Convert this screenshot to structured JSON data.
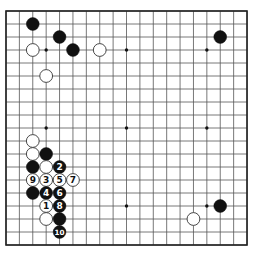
{
  "board": {
    "size": 19,
    "origin_x": 6,
    "origin_y": 11,
    "step_x": 13.39,
    "step_y": 13.0,
    "stone_radius": 6.4,
    "colors": {
      "background": "#ffffff",
      "line": "#555555",
      "border": "#222222",
      "black_stone": "#111111",
      "white_stone": "#ffffff",
      "white_outline": "#333333",
      "star": "#111111"
    },
    "star_points": [
      [
        3,
        3
      ],
      [
        9,
        3
      ],
      [
        15,
        3
      ],
      [
        3,
        9
      ],
      [
        9,
        9
      ],
      [
        15,
        9
      ],
      [
        3,
        15
      ],
      [
        9,
        15
      ],
      [
        15,
        15
      ]
    ],
    "stones": [
      {
        "color": "black",
        "col": 2,
        "row": 1,
        "label": ""
      },
      {
        "color": "black",
        "col": 4,
        "row": 2,
        "label": ""
      },
      {
        "color": "black",
        "col": 5,
        "row": 3,
        "label": ""
      },
      {
        "color": "white",
        "col": 2,
        "row": 3,
        "label": ""
      },
      {
        "color": "white",
        "col": 7,
        "row": 3,
        "label": ""
      },
      {
        "color": "white",
        "col": 3,
        "row": 5,
        "label": ""
      },
      {
        "color": "black",
        "col": 16,
        "row": 2,
        "label": ""
      },
      {
        "color": "white",
        "col": 2,
        "row": 10,
        "label": ""
      },
      {
        "color": "white",
        "col": 2,
        "row": 11,
        "label": ""
      },
      {
        "color": "black",
        "col": 3,
        "row": 11,
        "label": ""
      },
      {
        "color": "black",
        "col": 2,
        "row": 12,
        "label": ""
      },
      {
        "color": "white",
        "col": 3,
        "row": 12,
        "label": ""
      },
      {
        "color": "black",
        "col": 4,
        "row": 12,
        "label": "2"
      },
      {
        "color": "white",
        "col": 2,
        "row": 13,
        "label": "9"
      },
      {
        "color": "white",
        "col": 3,
        "row": 13,
        "label": "3"
      },
      {
        "color": "white",
        "col": 4,
        "row": 13,
        "label": "5"
      },
      {
        "color": "white",
        "col": 5,
        "row": 13,
        "label": "7"
      },
      {
        "color": "black",
        "col": 2,
        "row": 14,
        "label": ""
      },
      {
        "color": "black",
        "col": 3,
        "row": 14,
        "label": "4"
      },
      {
        "color": "black",
        "col": 4,
        "row": 14,
        "label": "6"
      },
      {
        "color": "white",
        "col": 3,
        "row": 15,
        "label": "1"
      },
      {
        "color": "black",
        "col": 4,
        "row": 15,
        "label": "8"
      },
      {
        "color": "white",
        "col": 3,
        "row": 16,
        "label": ""
      },
      {
        "color": "black",
        "col": 4,
        "row": 16,
        "label": ""
      },
      {
        "color": "black",
        "col": 4,
        "row": 17,
        "label": "10"
      },
      {
        "color": "black",
        "col": 16,
        "row": 15,
        "label": ""
      },
      {
        "color": "white",
        "col": 14,
        "row": 16,
        "label": ""
      }
    ]
  }
}
